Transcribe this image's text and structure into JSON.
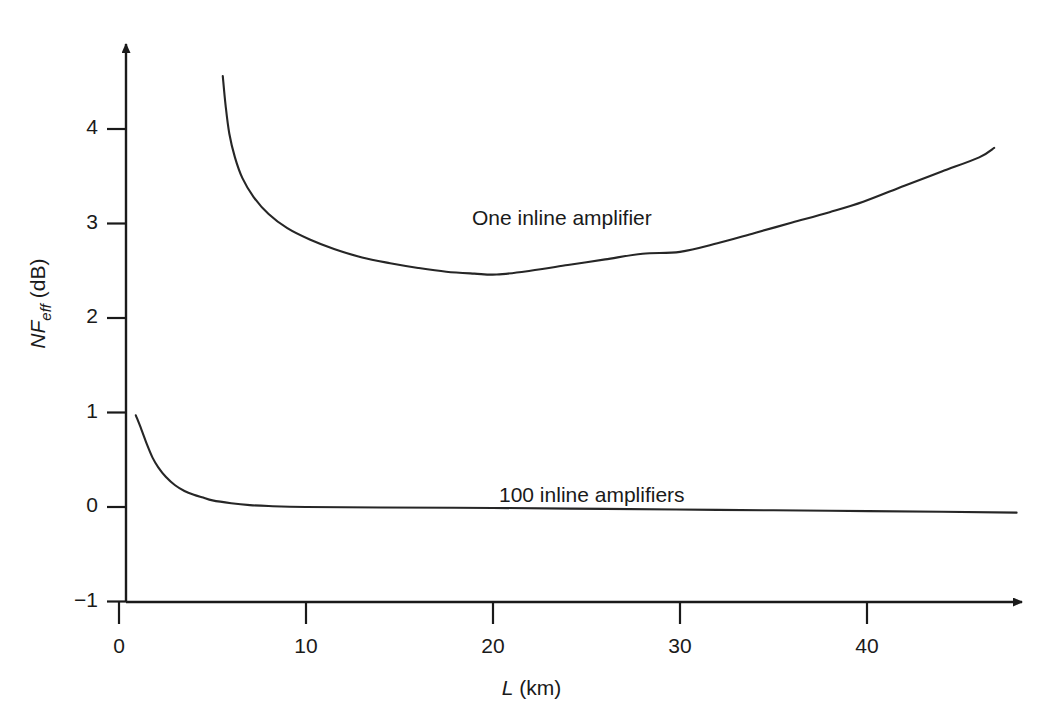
{
  "figure": {
    "background": "#ffffff",
    "line_color": "#262626",
    "axis_color": "#1a1a1a"
  },
  "axes": {
    "x": {
      "title_plain": " (km)",
      "title_italic": "L",
      "ticks": [
        "0",
        "10",
        "20",
        "30",
        "40"
      ],
      "tick_values": [
        0,
        10,
        20,
        30,
        40
      ],
      "range": [
        -1.0,
        50.0
      ]
    },
    "y": {
      "title_italic": "NF",
      "title_sub": "eff",
      "title_plain": " (dB)",
      "ticks": [
        "4",
        "3",
        "2",
        "1",
        "0",
        "−1"
      ],
      "tick_values": [
        4,
        3,
        2,
        1,
        0,
        -1
      ],
      "range": [
        -1.4,
        5.0
      ]
    }
  },
  "annotations": {
    "one_amplifier": "One inline amplifier",
    "hundred_amplifiers": "100 inline amplifiers"
  },
  "chart_data": {
    "type": "line",
    "title": "",
    "xlabel": "L (km)",
    "ylabel": "NF_eff (dB)",
    "xlim": [
      -1.0,
      50.0
    ],
    "ylim": [
      -1.4,
      5.0
    ],
    "grid": false,
    "legend": "inline-annotations",
    "series": [
      {
        "name": "One inline amplifier",
        "label_position": [
          23.5,
          3.0
        ],
        "points": [
          [
            5.55,
            4.56
          ],
          [
            5.7,
            4.25
          ],
          [
            5.9,
            3.95
          ],
          [
            6.2,
            3.7
          ],
          [
            6.6,
            3.48
          ],
          [
            7.2,
            3.28
          ],
          [
            8.0,
            3.1
          ],
          [
            9.0,
            2.95
          ],
          [
            10.2,
            2.83
          ],
          [
            11.5,
            2.73
          ],
          [
            13.0,
            2.64
          ],
          [
            14.5,
            2.58
          ],
          [
            16.0,
            2.53
          ],
          [
            17.5,
            2.49
          ],
          [
            19.0,
            2.47
          ],
          [
            20.2,
            2.46
          ],
          [
            22.0,
            2.5
          ],
          [
            24.0,
            2.56
          ],
          [
            26.0,
            2.62
          ],
          [
            28.0,
            2.68
          ],
          [
            30.0,
            2.7
          ],
          [
            32.0,
            2.79
          ],
          [
            34.0,
            2.9
          ],
          [
            36.0,
            3.01
          ],
          [
            38.0,
            3.12
          ],
          [
            39.8,
            3.23
          ],
          [
            42.0,
            3.4
          ],
          [
            44.0,
            3.55
          ],
          [
            46.0,
            3.7
          ],
          [
            46.8,
            3.8
          ]
        ]
      },
      {
        "name": "100 inline amplifiers",
        "label_position": [
          21.5,
          0.28
        ],
        "points": [
          [
            0.9,
            0.97
          ],
          [
            1.2,
            0.82
          ],
          [
            1.5,
            0.66
          ],
          [
            1.8,
            0.52
          ],
          [
            2.1,
            0.42
          ],
          [
            2.5,
            0.32
          ],
          [
            3.0,
            0.23
          ],
          [
            3.5,
            0.17
          ],
          [
            4.0,
            0.13
          ],
          [
            4.5,
            0.1
          ],
          [
            5.0,
            0.07
          ],
          [
            6.0,
            0.04
          ],
          [
            7.0,
            0.02
          ],
          [
            8.0,
            0.01
          ],
          [
            10.0,
            0.0
          ],
          [
            14.0,
            -0.005
          ],
          [
            20.0,
            -0.01
          ],
          [
            26.0,
            -0.02
          ],
          [
            32.0,
            -0.03
          ],
          [
            38.0,
            -0.04
          ],
          [
            44.0,
            -0.05
          ],
          [
            48.0,
            -0.06
          ]
        ]
      }
    ]
  }
}
